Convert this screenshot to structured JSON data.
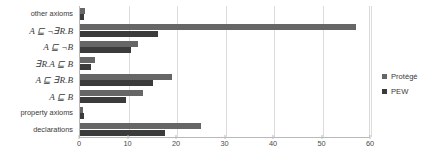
{
  "chart_data": {
    "type": "bar",
    "orientation": "horizontal",
    "title": "",
    "xlabel": "",
    "ylabel": "",
    "xlim": [
      0,
      60
    ],
    "xticks": [
      0,
      10,
      20,
      30,
      40,
      50,
      60
    ],
    "grid": true,
    "legend_position": "right",
    "categories": [
      "other axioms",
      "A ⊑ ¬∃R.B",
      "A ⊑ ¬B",
      "∃R.A ⊑ B",
      "A ⊑ ∃R.B",
      "A ⊑ B",
      "property axioms",
      "declarations"
    ],
    "series": [
      {
        "name": "Protégé",
        "color": "#666666",
        "values": [
          1.0,
          57.0,
          12.0,
          3.0,
          19.0,
          13.0,
          0.6,
          25.0
        ]
      },
      {
        "name": "PEW",
        "color": "#3b3b3b",
        "values": [
          0.8,
          16.0,
          10.5,
          2.2,
          15.0,
          9.5,
          0.8,
          17.5
        ]
      }
    ]
  },
  "legend": {
    "items": [
      {
        "label": "Protégé",
        "color": "#666666"
      },
      {
        "label": "PEW",
        "color": "#3b3b3b"
      }
    ]
  },
  "axis": {
    "x_tick_labels": [
      "0",
      "10",
      "20",
      "30",
      "40",
      "50",
      "60"
    ]
  }
}
